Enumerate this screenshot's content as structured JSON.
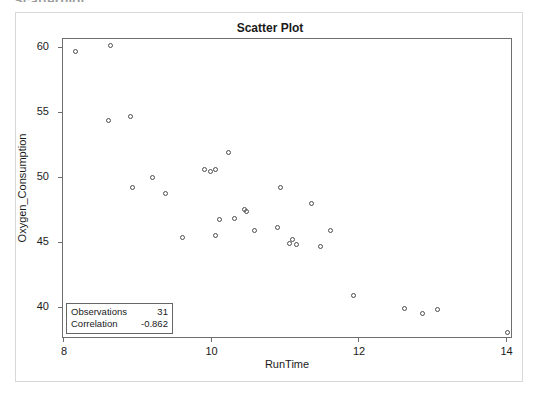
{
  "top_fragment": "Scatterplot",
  "chart_title": "Scatter Plot",
  "stats": {
    "observations_label": "Observations",
    "observations_value": "31",
    "correlation_label": "Correlation",
    "correlation_value": "-0.862"
  },
  "chart_data": {
    "type": "scatter",
    "title": "Scatter Plot",
    "xlabel": "RunTime",
    "ylabel": "Oxygen_Consumption",
    "xlim": [
      8,
      14.1
    ],
    "ylim": [
      37.5,
      60.6
    ],
    "xticks": [
      8,
      10,
      12,
      14
    ],
    "xtick_labels": [
      "8",
      "10",
      "12",
      "14"
    ],
    "yticks": [
      40,
      45,
      50,
      55,
      60
    ],
    "ytick_labels": [
      "40",
      "45",
      "50",
      "55",
      "60"
    ],
    "grid": false,
    "legend": null,
    "marker": "open-circle",
    "marker_color": "#4d4d4d",
    "n_points": 31,
    "correlation": -0.862,
    "points": [
      {
        "x": 8.17,
        "y": 59.57
      },
      {
        "x": 8.65,
        "y": 60.06
      },
      {
        "x": 8.63,
        "y": 54.3
      },
      {
        "x": 8.92,
        "y": 54.63
      },
      {
        "x": 8.95,
        "y": 49.16
      },
      {
        "x": 9.22,
        "y": 49.87
      },
      {
        "x": 9.4,
        "y": 48.67
      },
      {
        "x": 9.63,
        "y": 45.31
      },
      {
        "x": 9.93,
        "y": 50.54
      },
      {
        "x": 10.0,
        "y": 50.39
      },
      {
        "x": 10.07,
        "y": 50.55
      },
      {
        "x": 10.08,
        "y": 45.44
      },
      {
        "x": 10.13,
        "y": 46.67
      },
      {
        "x": 10.25,
        "y": 51.86
      },
      {
        "x": 10.33,
        "y": 46.77
      },
      {
        "x": 10.47,
        "y": 47.47
      },
      {
        "x": 10.5,
        "y": 47.27
      },
      {
        "x": 10.6,
        "y": 45.79
      },
      {
        "x": 10.95,
        "y": 49.09
      },
      {
        "x": 10.91,
        "y": 46.08
      },
      {
        "x": 11.08,
        "y": 44.81
      },
      {
        "x": 11.12,
        "y": 45.12
      },
      {
        "x": 11.17,
        "y": 44.75
      },
      {
        "x": 11.37,
        "y": 47.92
      },
      {
        "x": 11.5,
        "y": 44.61
      },
      {
        "x": 11.63,
        "y": 45.79
      },
      {
        "x": 11.95,
        "y": 40.84
      },
      {
        "x": 12.63,
        "y": 39.81
      },
      {
        "x": 12.88,
        "y": 39.44
      },
      {
        "x": 13.08,
        "y": 39.71
      },
      {
        "x": 14.03,
        "y": 37.99
      }
    ]
  }
}
